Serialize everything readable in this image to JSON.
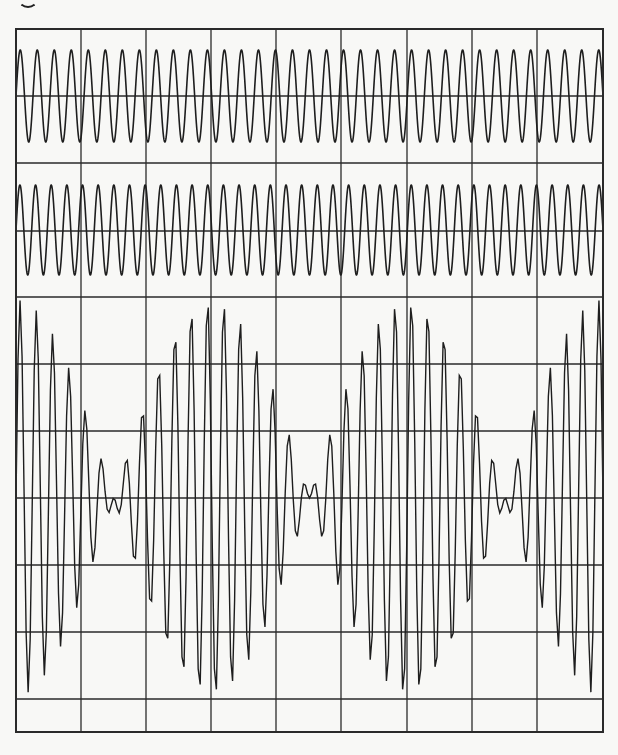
{
  "colors": {
    "background": "#f8f8f6",
    "grid": "#2a2a2a",
    "trace": "#1e1e1e"
  },
  "frame": {
    "left": 16,
    "top": 29,
    "right": 603,
    "bottom": 732
  },
  "grid": {
    "vertical_x": [
      16,
      81,
      146,
      211,
      276,
      341,
      407,
      472,
      537,
      603
    ],
    "horizontal_y": [
      29,
      96,
      163,
      231,
      297,
      364,
      431,
      498,
      565,
      632,
      699,
      732
    ]
  },
  "chart_data": [
    {
      "type": "line",
      "title": "",
      "name": "wave-1",
      "description": "Sinusoid, constant amplitude",
      "cycles_across_width": 34.5,
      "center_y": 96,
      "amplitude_px": 46,
      "grid": true,
      "xlabel": "",
      "ylabel": ""
    },
    {
      "type": "line",
      "title": "",
      "name": "wave-2",
      "description": "Sinusoid, constant amplitude, slightly higher frequency",
      "cycles_across_width": 37.5,
      "center_y": 230,
      "amplitude_px": 45,
      "grid": true,
      "xlabel": "",
      "ylabel": ""
    },
    {
      "type": "line",
      "title": "",
      "name": "sum-beat",
      "description": "Sum of wave-1 and wave-2 showing beats (3 beat envelopes across width)",
      "components": [
        "wave-1",
        "wave-2"
      ],
      "beats_across_width": 3,
      "node_x": [
        16,
        211,
        407,
        603
      ],
      "center_y": 498,
      "peak_amplitude_px": 198,
      "grid": true,
      "xlabel": "",
      "ylabel": ""
    }
  ]
}
